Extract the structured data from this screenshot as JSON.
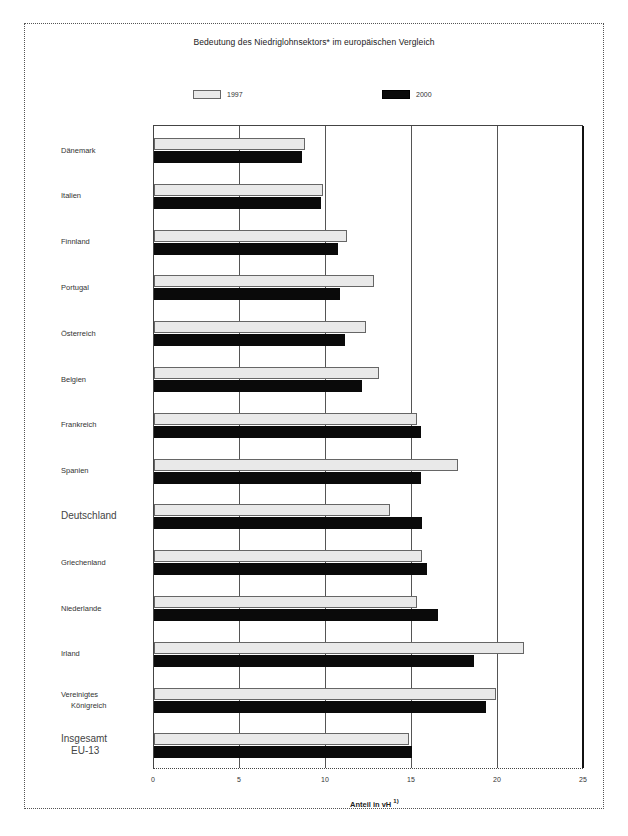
{
  "chart_data": {
    "type": "bar",
    "orientation": "horizontal",
    "title": "Bedeutung des Niedriglohnsektors* im europäischen Vergleich",
    "xlabel": "Anteil in vH",
    "xlabel_footnote": "1)",
    "ylabel": "",
    "xlim": [
      0,
      25
    ],
    "xticks": [
      "0",
      "5",
      "10",
      "15",
      "20",
      "25"
    ],
    "grid": true,
    "legend_position": "top",
    "categories": [
      "Dänemark",
      "Italien",
      "Finnland",
      "Portugal",
      "Österreich",
      "Belgien",
      "Frankreich",
      "Spanien",
      "Deutschland",
      "Griechenland",
      "Niederlande",
      "Irland",
      "Vereinigtes Königreich",
      "Insgesamt EU-13"
    ],
    "series": [
      {
        "name": "1997",
        "color": "#e9e9e9",
        "values": [
          8.8,
          9.8,
          11.2,
          12.8,
          12.3,
          13.1,
          15.3,
          17.7,
          13.7,
          15.6,
          15.3,
          21.5,
          19.9,
          14.8
        ]
      },
      {
        "name": "2000",
        "color": "#0a0a0a",
        "values": [
          8.6,
          9.7,
          10.7,
          10.8,
          11.1,
          12.1,
          15.5,
          15.5,
          15.6,
          15.9,
          16.5,
          18.6,
          19.3,
          15.0
        ]
      }
    ]
  },
  "labels": {
    "title": "Bedeutung des Niedriglohnsektors* im europäischen Vergleich",
    "legend": [
      "1997",
      "2000"
    ],
    "categories": [
      [
        "Dänemark"
      ],
      [
        "Italien"
      ],
      [
        "Finnland"
      ],
      [
        "Portugal"
      ],
      [
        "Österreich"
      ],
      [
        "Belgien"
      ],
      [
        "Frankreich"
      ],
      [
        "Spanien"
      ],
      [
        "Deutschland"
      ],
      [
        "Griechenland"
      ],
      [
        "Niederlande"
      ],
      [
        "Irland"
      ],
      [
        "Vereinigtes",
        "Königreich"
      ],
      [
        "Insgesamt",
        "EU-13"
      ]
    ],
    "xticks": [
      "0",
      "5",
      "10",
      "15",
      "20",
      "25"
    ],
    "xlabel": "Anteil in vH",
    "xlabel_sup": "1)"
  }
}
